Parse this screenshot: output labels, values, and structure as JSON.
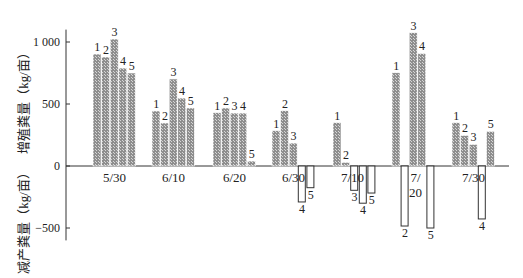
{
  "chart_data": {
    "type": "bar",
    "title": "",
    "ylabel_positive": "增殖粪量（kg/亩）",
    "ylabel_negative": "减产粪量（kg/亩）",
    "xlabel": "",
    "ylim": [
      -600,
      1100
    ],
    "yticks": [
      1000,
      500,
      0,
      -500
    ],
    "ytick_labels": [
      "1 000",
      "500",
      "0",
      "−500"
    ],
    "series_labels": [
      "1",
      "2",
      "3",
      "4",
      "5"
    ],
    "groups": [
      {
        "label": "5/30",
        "values": [
          903,
          879,
          1024,
          790,
          750
        ]
      },
      {
        "label": "6/10",
        "values": [
          444,
          347,
          702,
          548,
          468
        ]
      },
      {
        "label": "6/20",
        "values": [
          430,
          468,
          427,
          427,
          40
        ]
      },
      {
        "label": "6/30",
        "values": [
          285,
          446,
          185,
          -290,
          -175
        ]
      },
      {
        "label": "7/10",
        "values": [
          350,
          30,
          -196,
          -300,
          -218
        ]
      },
      {
        "label": "7/20",
        "values": [
          752,
          -484,
          1075,
          908,
          -500
        ]
      },
      {
        "label": "7/30",
        "values": [
          350,
          247,
          175,
          -427,
          280
        ]
      }
    ],
    "legend": "none",
    "grid": false,
    "colors": {
      "positive_fill": "#9a9a9a",
      "negative_fill": "#ffffff",
      "stroke": "#333333"
    }
  }
}
